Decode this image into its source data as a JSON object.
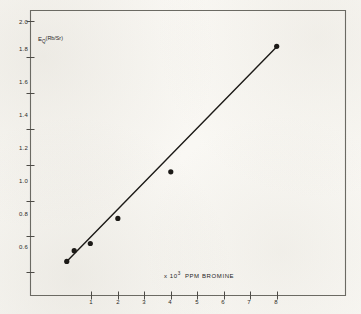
{
  "chart_data": {
    "type": "scatter",
    "title": "",
    "subtitle": "",
    "xlabel": "x 10³ PPM BROMINE",
    "xlabel_parts": {
      "prefix": "x 10",
      "exponent": "3",
      "suffix": "PPM  BROMINE"
    },
    "ylabel": "E_Q (Rb/Sr)",
    "ylabel_parts": {
      "symbol": "E",
      "subscript": "Q",
      "unit": "(Rb/Sr)"
    },
    "x_ticks": [
      1,
      2,
      3,
      4,
      5,
      6,
      7,
      8
    ],
    "x_tick_labels": [
      "1",
      "2",
      "3",
      "4",
      "5",
      "6",
      "7",
      "8"
    ],
    "y_ticks": [
      0.6,
      0.8,
      1.0,
      1.2,
      1.4,
      1.6,
      1.8,
      2.0
    ],
    "y_tick_labels": [
      "0.6",
      "0.8",
      "1.0",
      "1.2",
      "1.4",
      "1.6",
      "1.8",
      "2.0"
    ],
    "xlim": [
      -1.3,
      10.6
    ],
    "ylim": [
      0.47,
      2.06
    ],
    "grid": false,
    "legend": false,
    "legend_position": "none",
    "marker": "filled-circle",
    "marker_color": "#1c1a17",
    "line_color": "#1c1a17",
    "frame_color": "#6b6a63",
    "background_color": "#fbfaf7",
    "series": [
      {
        "name": "E_Q (Rb/Sr) vs bromine",
        "x": [
          0.07,
          0.35,
          0.96,
          2.0,
          4.0,
          8.0
        ],
        "y": [
          0.66,
          0.72,
          0.76,
          0.9,
          1.16,
          1.86
        ]
      }
    ],
    "fit_line": {
      "name": "best fit",
      "x": [
        0.04,
        8.05
      ],
      "y": [
        0.655,
        1.865
      ]
    },
    "annotations": []
  }
}
